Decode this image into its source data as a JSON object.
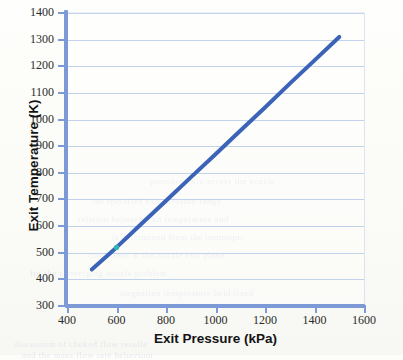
{
  "figure": {
    "background_color": "#fdfdfa",
    "bleed_through_notes": [
      "scanned textbook page",
      "faint reverse-side text visible",
      "no title rendered above plot"
    ]
  },
  "chart_data": {
    "type": "line",
    "title": "",
    "xlabel": "Exit Pressure (kPa)",
    "ylabel": "Exit Temperature (K)",
    "xlim": [
      400,
      1600
    ],
    "ylim": [
      300,
      1400
    ],
    "xticks": [
      400,
      600,
      800,
      1000,
      1200,
      1400,
      1600
    ],
    "yticks": [
      300,
      400,
      500,
      600,
      700,
      800,
      900,
      1000,
      1100,
      1200,
      1300,
      1400
    ],
    "xtick_labels": [
      "400",
      "600",
      "800",
      "1000",
      "1200",
      "1400",
      "1600"
    ],
    "ytick_labels": [
      "300",
      "400",
      "500",
      "600",
      "700",
      "800",
      "900",
      "1000",
      "1100",
      "1200",
      "1300",
      "1400"
    ],
    "grid": {
      "horizontal": true,
      "vertical": false,
      "color": "#aec4e8"
    },
    "legend": null,
    "legend_position": "none",
    "series": [
      {
        "name": "Exit Temperature",
        "color": "#3b63b8",
        "line_width": 4,
        "marker": "none",
        "x": [
          500,
          600,
          700,
          800,
          900,
          1000,
          1100,
          1200,
          1300,
          1400,
          1500
        ],
        "values": [
          437,
          520,
          608,
          695,
          783,
          870,
          958,
          1045,
          1135,
          1222,
          1310
        ]
      }
    ],
    "annotations": [
      {
        "name": "cyan-print-artifact",
        "x": 600,
        "y": 520,
        "color": "#2fb9ae",
        "note": "small teal mis-registration speck on the plotted line"
      }
    ]
  },
  "bleed_text": [
    {
      "text": "the specified exit pressure range",
      "x": 92,
      "y": 196
    },
    {
      "text": "relation between exit temperature and",
      "x": 78,
      "y": 214
    },
    {
      "text": "is determined from the isentropic",
      "x": 112,
      "y": 232
    },
    {
      "text": "conditions at the nozzle exit plane",
      "x": 88,
      "y": 250
    },
    {
      "text": "for the converging nozzle problem",
      "x": 30,
      "y": 268
    },
    {
      "text": "discussion of choked flow results",
      "x": 14,
      "y": 339
    },
    {
      "text": "and the mass flow rate behaviour",
      "x": 22,
      "y": 350
    },
    {
      "text": "pressure ratio across the nozzle",
      "x": 150,
      "y": 176
    },
    {
      "text": "stagnation temperature held fixed",
      "x": 120,
      "y": 288
    }
  ]
}
